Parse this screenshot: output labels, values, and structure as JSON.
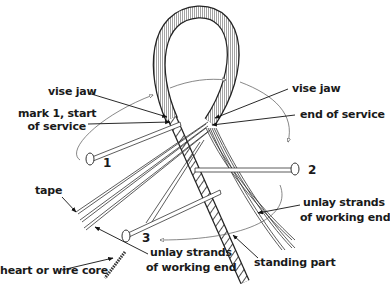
{
  "diagram": {
    "labels": {
      "vise_jaw_left": "vise jaw",
      "vise_jaw_right": "vise jaw",
      "mark_1_line1": "mark 1, start",
      "mark_1_line2": "of service",
      "end_of_service": "end of service",
      "tape": "tape",
      "heart_core": "heart or wire core",
      "unlay_left_line1": "unlay strands",
      "unlay_left_line2": "of working end",
      "unlay_right_line1": "unlay strands",
      "unlay_right_line2": "of working end",
      "standing_part": "standing part"
    },
    "fids": [
      {
        "number": "1"
      },
      {
        "number": "2"
      },
      {
        "number": "3"
      }
    ],
    "colors": {
      "ink": "#1a1a1a",
      "background": "#ffffff"
    }
  }
}
